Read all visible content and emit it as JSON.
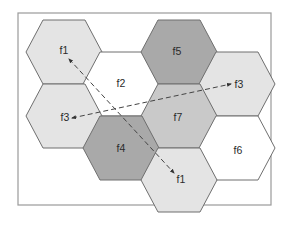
{
  "diagram": {
    "type": "hexagonal-cell-frequency-reuse",
    "frame": {
      "x": 18,
      "y": 13,
      "w": 253,
      "h": 192
    },
    "colors": {
      "light": "#e4e4e4",
      "medium": "#c9c9c9",
      "dark": "#a9a9a9",
      "white": "#ffffff",
      "stroke": "#6f6f6f"
    },
    "cells": [
      {
        "label": "f1",
        "cx": 64,
        "cy": 52,
        "shade": "light",
        "lx": 64,
        "ly": 51
      },
      {
        "label": "f2",
        "cx": 121,
        "cy": 84,
        "shade": "white",
        "lx": 121,
        "ly": 84
      },
      {
        "label": "f5",
        "cx": 179,
        "cy": 52,
        "shade": "dark",
        "lx": 177,
        "ly": 52
      },
      {
        "label": "f3",
        "cx": 237,
        "cy": 84,
        "shade": "light",
        "lx": 239,
        "ly": 85
      },
      {
        "label": "f3",
        "cx": 64,
        "cy": 116,
        "shade": "light",
        "lx": 65,
        "ly": 118
      },
      {
        "label": "f7",
        "cx": 179,
        "cy": 116,
        "shade": "medium",
        "lx": 178,
        "ly": 118
      },
      {
        "label": "f4",
        "cx": 121,
        "cy": 148,
        "shade": "dark",
        "lx": 121,
        "ly": 149
      },
      {
        "label": "f6",
        "cx": 237,
        "cy": 148,
        "shade": "white",
        "lx": 238,
        "ly": 151
      },
      {
        "label": "f1",
        "cx": 179,
        "cy": 180,
        "shade": "light",
        "lx": 181,
        "ly": 180
      }
    ],
    "arrows": [
      {
        "name": "f1-reuse-distance",
        "x1": 69,
        "y1": 59,
        "x2": 174,
        "y2": 173
      },
      {
        "name": "f3-reuse-distance",
        "x1": 72,
        "y1": 118,
        "x2": 231,
        "y2": 84
      }
    ]
  }
}
